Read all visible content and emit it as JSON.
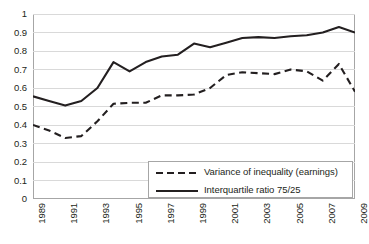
{
  "chart_data": {
    "type": "line",
    "title": "",
    "xlabel": "",
    "ylabel": "",
    "ylim": [
      0,
      1
    ],
    "xlim": [
      1989,
      2009
    ],
    "grid": true,
    "legend_position": "bottom-right",
    "x": [
      1989,
      1990,
      1991,
      1992,
      1993,
      1994,
      1995,
      1996,
      1997,
      1998,
      1999,
      2000,
      2001,
      2002,
      2003,
      2004,
      2005,
      2006,
      2007,
      2008,
      2009
    ],
    "xtick_labels": [
      "1989",
      "1991",
      "1993",
      "1995",
      "1997",
      "1999",
      "2001",
      "2003",
      "2005",
      "2007",
      "2009"
    ],
    "xtick_values": [
      1989,
      1991,
      1993,
      1995,
      1997,
      1999,
      2001,
      2003,
      2005,
      2007,
      2009
    ],
    "ytick_labels": [
      "0",
      "0.1",
      "0.2",
      "0.3",
      "0.4",
      "0.5",
      "0.6",
      "0.7",
      "0.8",
      "0.9",
      "1"
    ],
    "ytick_values": [
      0,
      0.1,
      0.2,
      0.3,
      0.4,
      0.5,
      0.6,
      0.7,
      0.8,
      0.9,
      1
    ],
    "series": [
      {
        "name": "Variance of inequality (earnings)",
        "style": "dashed",
        "color": "#231f20",
        "values": [
          0.4,
          0.37,
          0.33,
          0.34,
          0.42,
          0.515,
          0.52,
          0.52,
          0.56,
          0.56,
          0.565,
          0.6,
          0.67,
          0.685,
          0.68,
          0.675,
          0.7,
          0.69,
          0.64,
          0.73,
          0.58
        ]
      },
      {
        "name": "Interquartile ratio 75/25",
        "style": "solid",
        "color": "#231f20",
        "values": [
          0.555,
          0.53,
          0.505,
          0.53,
          0.6,
          0.74,
          0.69,
          0.74,
          0.77,
          0.78,
          0.84,
          0.82,
          0.845,
          0.87,
          0.875,
          0.87,
          0.88,
          0.885,
          0.9,
          0.93,
          0.9
        ]
      }
    ]
  },
  "legend": {
    "entries": [
      {
        "label": "Variance of inequality (earnings)",
        "style": "dashed"
      },
      {
        "label": "Interquartile ratio 75/25",
        "style": "solid"
      }
    ]
  },
  "colors": {
    "line": "#231f20",
    "grid": "#d9d9d9",
    "frame": "#a6a6a6",
    "background": "#ffffff",
    "text": "#231f20"
  }
}
